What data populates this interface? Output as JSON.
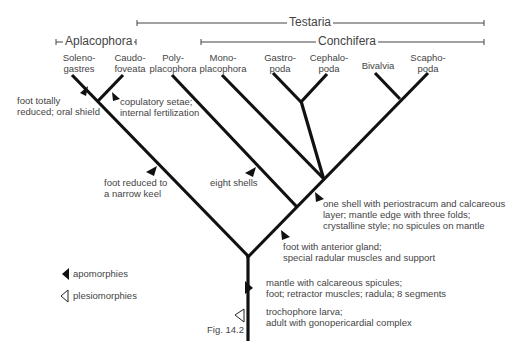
{
  "groups": {
    "testaria": "Testaria",
    "conchifera": "Conchifera",
    "aplacophora": "Aplacophora"
  },
  "taxa": [
    {
      "line1": "Soleno-",
      "line2": "gastres"
    },
    {
      "line1": "Caudo-",
      "line2": "foveata"
    },
    {
      "line1": "Poly-",
      "line2": "placophora"
    },
    {
      "line1": "Mono-",
      "line2": "placophora"
    },
    {
      "line1": "Gastro-",
      "line2": "poda"
    },
    {
      "line1": "Cephalo-",
      "line2": "poda"
    },
    {
      "line1": "Bivalvia",
      "line2": ""
    },
    {
      "line1": "Scapho-",
      "line2": "poda"
    }
  ],
  "characters": {
    "solenogastres": {
      "line1": "foot totally",
      "line2": "reduced; oral shield"
    },
    "caudofoveata": {
      "line1": "copulatory setae;",
      "line2": "internal fertilization"
    },
    "aplacophora": {
      "line1": "foot reduced to",
      "line2": "a narrow keel"
    },
    "polyplacophora": {
      "line1": "eight shells"
    },
    "conchifera": {
      "line1": "one shell with periostracum and calcareous",
      "line2": "layer; mantle edge with three folds;",
      "line3": "crystalline style; no spicules on mantle"
    },
    "testaria": {
      "line1": "foot with anterior gland;",
      "line2": "special radular muscles and support"
    },
    "mollusca_apo": {
      "line1": "mantle with calcareous spicules;",
      "line2": "foot; retractor muscles; radula; 8 segments"
    },
    "mollusca_plesio": {
      "line1": "trochophore larva;",
      "line2": "adult with gonopericardial complex"
    }
  },
  "legend": {
    "apomorphies": "apomorphies",
    "plesiomorphies": "plesiomorphies"
  },
  "figure_label": "Fig. 14.2"
}
